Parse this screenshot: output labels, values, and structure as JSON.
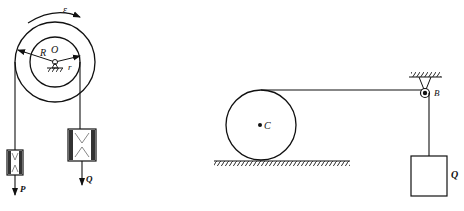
{
  "figure_left": {
    "title": "Stepped pulley with two hanging weights",
    "labels": {
      "angular_accel": "ε",
      "outer_radius": "R",
      "center": "O",
      "inner_radius": "r",
      "weight_left": "P",
      "weight_right": "Q"
    }
  },
  "figure_right": {
    "title": "Rolling cylinder pulled over fixed pulley",
    "labels": {
      "cylinder_center": "C",
      "pulley": "B",
      "weight": "Q"
    }
  },
  "colors": {
    "stroke": "#111111",
    "background": "#ffffff"
  }
}
